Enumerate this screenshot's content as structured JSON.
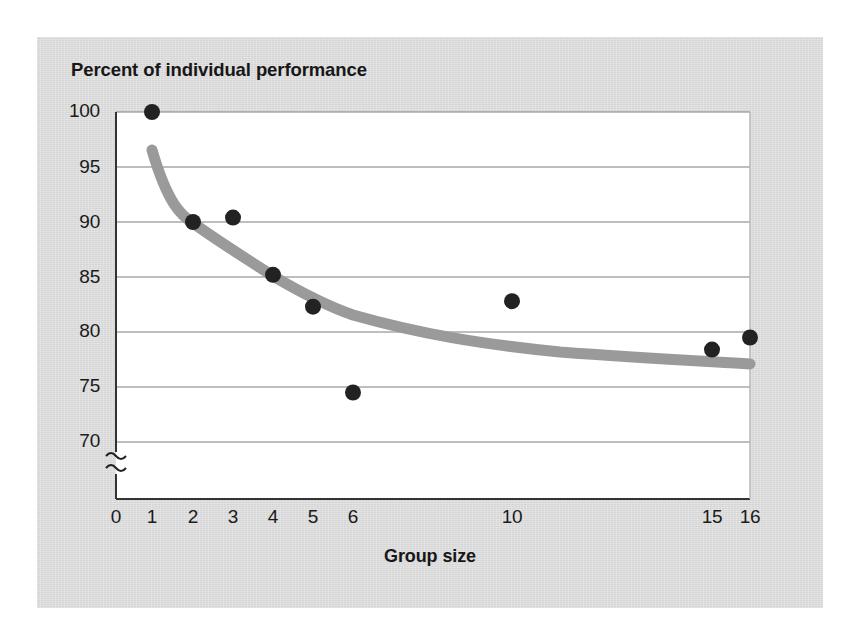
{
  "figure": {
    "title": "Percent of individual performance",
    "xlabel": "Group size",
    "panel_color": "#dcdcdc",
    "plot_bg": "#ffffff",
    "point_color": "#222222",
    "curve_color": "#9a9a9a",
    "gridline_color": "#7d7d7d",
    "axis_color": "#333333",
    "axis_break_symbol": "≈"
  },
  "chart_data": {
    "type": "scatter",
    "title": "Percent of individual performance",
    "xlabel": "Group size",
    "ylabel": "Percent of individual performance",
    "x": [
      1,
      2,
      3,
      4,
      5,
      6,
      10,
      15,
      16
    ],
    "values": [
      100.0,
      90.0,
      90.4,
      85.2,
      82.3,
      74.5,
      82.8,
      78.4,
      79.5
    ],
    "series": [
      {
        "name": "Observed group performance",
        "x": [
          1,
          2,
          3,
          4,
          5,
          6,
          10,
          15,
          16
        ],
        "values": [
          100.0,
          90.0,
          90.4,
          85.2,
          82.3,
          74.5,
          82.8,
          78.4,
          79.5
        ],
        "marker": "filled-circle",
        "color": "#222222"
      },
      {
        "name": "Fitted trend curve",
        "type": "line",
        "x": [
          1,
          2,
          3,
          4,
          5,
          6,
          8,
          10,
          12,
          14,
          16
        ],
        "values": [
          97.0,
          90.2,
          87.0,
          84.8,
          83.2,
          82.0,
          80.3,
          79.1,
          78.4,
          77.8,
          77.3
        ],
        "color": "#9a9a9a"
      }
    ],
    "xticks": [
      "0",
      "1",
      "2",
      "3",
      "4",
      "5",
      "6",
      "10",
      "15",
      "16"
    ],
    "xtick_values": [
      0,
      1,
      2,
      3,
      4,
      5,
      6,
      10,
      15,
      16
    ],
    "yticks": [
      "70",
      "75",
      "80",
      "85",
      "90",
      "95",
      "100"
    ],
    "ytick_values": [
      70,
      75,
      80,
      85,
      90,
      95,
      100
    ],
    "ylim": [
      70,
      100
    ],
    "y_axis_break": true,
    "grid": "horizontal",
    "legend": "none"
  },
  "geometry": {
    "xtick_px": [
      116,
      152,
      193,
      233,
      273,
      313,
      353,
      512,
      712,
      750
    ],
    "ytick_px": [
      442,
      387,
      332,
      278,
      223,
      168,
      112
    ]
  }
}
